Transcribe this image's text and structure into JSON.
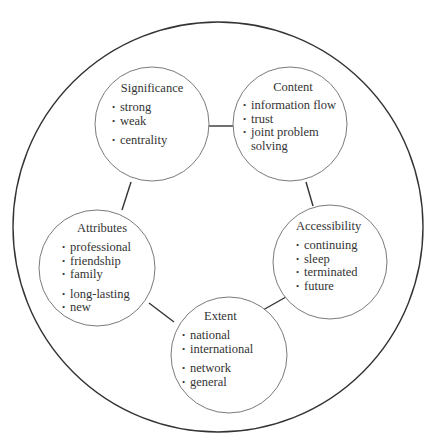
{
  "diagram": {
    "type": "network-concept-diagram",
    "outer_circle": {
      "cx": 218,
      "cy": 227,
      "r": 205,
      "stroke": "#333333"
    },
    "node_stroke": "#7a7a7a",
    "link_stroke": "#333333",
    "nodes": [
      {
        "id": "significance",
        "title": "Significance",
        "cx": 152,
        "cy": 124,
        "r": 57,
        "groups": [
          [
            "strong",
            "weak"
          ],
          [
            "centrality"
          ]
        ]
      },
      {
        "id": "content",
        "title": "Content",
        "cx": 290,
        "cy": 124,
        "r": 57,
        "groups": [
          [
            "information flow",
            "trust",
            "joint problem",
            "solving"
          ]
        ]
      },
      {
        "id": "attributes",
        "title": "Attributes",
        "cx": 97,
        "cy": 268,
        "r": 58,
        "groups": [
          [
            "professional",
            "friendship",
            "family"
          ],
          [
            "long-lasting",
            "new"
          ]
        ]
      },
      {
        "id": "accessibility",
        "title": "Accessibility",
        "cx": 330,
        "cy": 262,
        "r": 57,
        "groups": [
          [
            "continuing",
            "sleep",
            "terminated",
            "future"
          ]
        ]
      },
      {
        "id": "extent",
        "title": "Extent",
        "cx": 229,
        "cy": 355,
        "r": 58,
        "groups": [
          [
            "national",
            "international"
          ],
          [
            "network",
            "general"
          ]
        ]
      }
    ],
    "links": [
      {
        "from": "significance",
        "to": "content",
        "x1": 208,
        "y1": 126,
        "x2": 233,
        "y2": 126
      },
      {
        "from": "significance",
        "to": "attributes",
        "x1": 131,
        "y1": 182,
        "x2": 122,
        "y2": 210
      },
      {
        "from": "content",
        "to": "accessibility",
        "x1": 306,
        "y1": 182,
        "x2": 313,
        "y2": 210
      },
      {
        "from": "attributes",
        "to": "extent",
        "x1": 149,
        "y1": 303,
        "x2": 173,
        "y2": 322
      },
      {
        "from": "extent",
        "to": "accessibility",
        "x1": 262,
        "y1": 318,
        "x2": 286,
        "y2": 302
      }
    ]
  },
  "labels": {
    "significance": {
      "title": "Significance",
      "items": [
        "strong",
        "weak",
        "centrality"
      ]
    },
    "content": {
      "title": "Content",
      "items": [
        "information flow",
        "trust",
        "joint problem",
        "solving"
      ]
    },
    "attributes": {
      "title": "Attributes",
      "items": [
        "professional",
        "friendship",
        "family",
        "long-lasting",
        "new"
      ]
    },
    "accessibility": {
      "title": "Accessibility",
      "items": [
        "continuing",
        "sleep",
        "terminated",
        "future"
      ]
    },
    "extent": {
      "title": "Extent",
      "items": [
        "national",
        "international",
        "network",
        "general"
      ]
    },
    "bullet": "•"
  }
}
